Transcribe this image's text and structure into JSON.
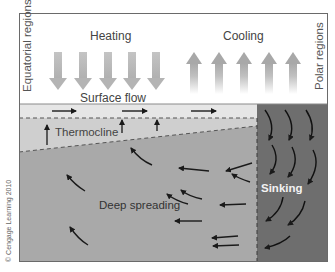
{
  "labels": {
    "equatorial": "Equatorial regions",
    "polar": "Polar regions",
    "heating": "Heating",
    "cooling": "Cooling",
    "surface_flow": "Surface flow",
    "thermocline": "Thermocline",
    "deep_spreading": "Deep spreading",
    "sinking": "Sinking",
    "copyright": "© Cengage Learning 2010"
  },
  "colors": {
    "surface_water": "#e6e6e6",
    "thermocline_layer": "#cfcfcf",
    "deep_water": "#a9a9a9",
    "sinking_column": "#6e6e6e",
    "arrow": "#1a1a1a",
    "heat_arrow": "#b8b8b8"
  },
  "heating_arrow_count": 5,
  "cooling_arrow_count": 5
}
